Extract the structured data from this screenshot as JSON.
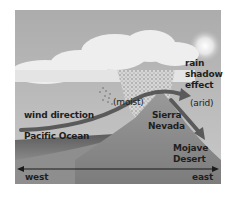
{
  "diagram": {
    "type": "rain shadow effect illustration",
    "labels": {
      "rain_shadow_line1": "rain",
      "rain_shadow_line2": "shadow",
      "rain_shadow_line3": "effect",
      "wind_direction": "wind direction",
      "moist": "(moist)",
      "arid": "(arid)",
      "pacific_ocean": "Pacific Ocean",
      "sierra_line1": "Sierra",
      "sierra_line2": "Nevada",
      "mojave_line1": "Mojave",
      "mojave_line2": "Desert",
      "west": "west",
      "east": "east"
    },
    "elements": [
      "clouds",
      "sun",
      "rain",
      "wind-arrow",
      "descending-air-arrow",
      "mountain",
      "ocean",
      "west-east-axis"
    ],
    "colors": {
      "sky": "#b9b9b9",
      "cloud": "#ececec",
      "mountain": "#8a8a8a",
      "ocean": "#6e6e6e",
      "arrow": "#5a5a5a",
      "axis": "#1a1a1a"
    }
  }
}
